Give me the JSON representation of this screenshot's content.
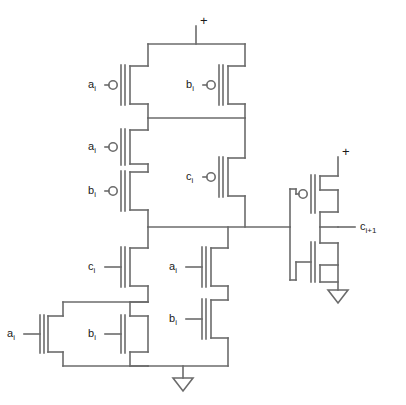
{
  "diagram": {
    "stroke_color": "#6b6b6b",
    "text_color": "#1a1a1a",
    "background": "#ffffff",
    "supply_label": "+",
    "ground_symbol": "ground-triangle"
  },
  "supplies": [
    {
      "name": "vdd-left",
      "label": "+"
    },
    {
      "name": "vdd-right",
      "label": "+"
    }
  ],
  "output": {
    "name": "carry-out",
    "base": "c",
    "sub": "i+1",
    "full": "c i+1"
  },
  "transistors": [
    {
      "id": "p1",
      "type": "pmos",
      "base": "a",
      "sub": "i",
      "role": "pullup-parallel-left"
    },
    {
      "id": "p2",
      "type": "pmos",
      "base": "b",
      "sub": "i",
      "role": "pullup-parallel-right"
    },
    {
      "id": "p3",
      "type": "pmos",
      "base": "a",
      "sub": "i",
      "role": "pullup-series-upper"
    },
    {
      "id": "p4",
      "type": "pmos",
      "base": "b",
      "sub": "i",
      "role": "pullup-series-lower"
    },
    {
      "id": "p5",
      "type": "pmos",
      "base": "c",
      "sub": "i",
      "role": "pullup-right-branch"
    },
    {
      "id": "n1",
      "type": "nmos",
      "base": "c",
      "sub": "i",
      "role": "pulldown-left-upper"
    },
    {
      "id": "n2",
      "type": "nmos",
      "base": "a",
      "sub": "i",
      "role": "pulldown-parallel-left"
    },
    {
      "id": "n3",
      "type": "nmos",
      "base": "b",
      "sub": "i",
      "role": "pulldown-parallel-right"
    },
    {
      "id": "n4",
      "type": "nmos",
      "base": "a",
      "sub": "i",
      "role": "pulldown-right-upper"
    },
    {
      "id": "n5",
      "type": "nmos",
      "base": "b",
      "sub": "i",
      "role": "pulldown-right-lower"
    },
    {
      "id": "p6",
      "type": "pmos",
      "base": "",
      "sub": "",
      "role": "inverter-pullup"
    },
    {
      "id": "n6",
      "type": "nmos",
      "base": "",
      "sub": "",
      "role": "inverter-pulldown"
    }
  ],
  "labels": {
    "p1": {
      "base": "a",
      "sub": "i"
    },
    "p2": {
      "base": "b",
      "sub": "i"
    },
    "p3": {
      "base": "a",
      "sub": "i"
    },
    "p4": {
      "base": "b",
      "sub": "i"
    },
    "p5": {
      "base": "c",
      "sub": "i"
    },
    "n1": {
      "base": "c",
      "sub": "i"
    },
    "n2": {
      "base": "a",
      "sub": "i"
    },
    "n3": {
      "base": "b",
      "sub": "i"
    },
    "n4": {
      "base": "a",
      "sub": "i"
    },
    "n5": {
      "base": "b",
      "sub": "i"
    },
    "out": {
      "base": "c",
      "sub": "i+1"
    },
    "vdd_top": "+",
    "vdd_right": "+"
  }
}
